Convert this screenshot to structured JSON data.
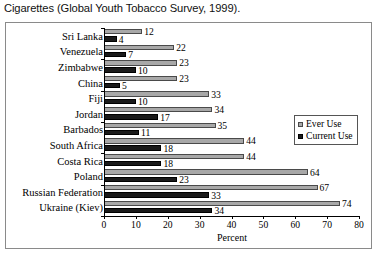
{
  "caption": "Cigarettes (Global Youth Tobacco Survey, 1999).",
  "legend": {
    "ever_label": "Ever Use",
    "current_label": "Current Use"
  },
  "colors": {
    "ever": "#a8a8a8",
    "current": "#1a1a1a",
    "frame": "#8a8a8a",
    "axis": "#000000"
  },
  "chart_data": {
    "type": "bar",
    "orientation": "horizontal",
    "title": "Cigarettes (Global Youth Tobacco Survey, 1999).",
    "xlabel": "Percent",
    "ylabel": "",
    "xlim": [
      0,
      80
    ],
    "xticks": [
      0,
      10,
      20,
      30,
      40,
      50,
      60,
      70,
      80
    ],
    "grid": false,
    "legend_position": "right-middle",
    "categories": [
      "Sri Lanka",
      "Venezuela",
      "Zimbabwe",
      "China",
      "Fiji",
      "Jordan",
      "Barbados",
      "South Africa",
      "Costa Rica",
      "Poland",
      "Russian Federation",
      "Ukraine (Kiev)"
    ],
    "series": [
      {
        "name": "Ever Use",
        "values": [
          12,
          22,
          23,
          23,
          33,
          34,
          35,
          44,
          44,
          64,
          67,
          74
        ]
      },
      {
        "name": "Current Use",
        "values": [
          4,
          7,
          10,
          5,
          10,
          17,
          11,
          18,
          18,
          23,
          33,
          34
        ]
      }
    ]
  }
}
